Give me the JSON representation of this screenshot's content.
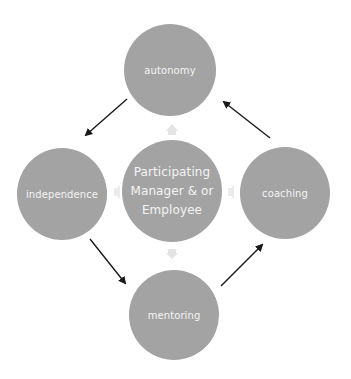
{
  "diagram": {
    "type": "cycle-with-hub",
    "colors": {
      "node_fill": "#a3a3a3",
      "node_text": "#f4f4f4",
      "cycle_arrow": "#1a1a1a",
      "hub_connector": "#e4e4e4",
      "background": "#ffffff"
    },
    "center": {
      "lines": [
        "Participating",
        "Manager & or",
        "Employee"
      ]
    },
    "nodes": {
      "autonomy": {
        "label": "autonomy"
      },
      "independence": {
        "label": "independence"
      },
      "coaching": {
        "label": "coaching"
      },
      "mentoring": {
        "label": "mentoring"
      }
    },
    "cycle_edges": [
      {
        "from": "autonomy",
        "to": "independence"
      },
      {
        "from": "independence",
        "to": "mentoring"
      },
      {
        "from": "mentoring",
        "to": "coaching"
      },
      {
        "from": "coaching",
        "to": "autonomy"
      }
    ],
    "hub_connectors": [
      {
        "from": "center",
        "to": "autonomy",
        "direction": "up"
      },
      {
        "from": "center",
        "to": "independence",
        "direction": "left"
      },
      {
        "from": "center",
        "to": "coaching",
        "direction": "right"
      },
      {
        "from": "center",
        "to": "mentoring",
        "direction": "down"
      }
    ]
  }
}
